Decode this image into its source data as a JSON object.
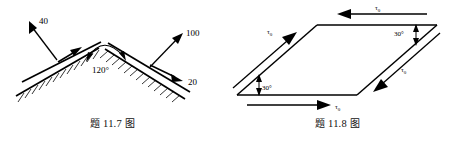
{
  "page": {
    "background_color": "#ffffff",
    "ink_color": "#000000",
    "width": 450,
    "height": 141
  },
  "figures": [
    {
      "id": "fig-11-7",
      "caption": "题 11.7 图",
      "caption_prefix": "题",
      "caption_number": "11.7",
      "caption_suffix": "图",
      "type": "engineering-diagram",
      "description": "V-shaped hatched bracket with apex angle and three force labels",
      "apex_angle": {
        "value": "120°",
        "label": "120°",
        "style": "double-headed-arc"
      },
      "labels": [
        {
          "name": "force-40",
          "text": "40",
          "direction": "up-left",
          "x": 36,
          "y": 22
        },
        {
          "name": "force-100",
          "text": "100",
          "direction": "up-right",
          "x": 196,
          "y": 33
        },
        {
          "name": "force-20",
          "text": "20",
          "direction": "down-right",
          "x": 206,
          "y": 82
        }
      ],
      "hatching": {
        "left_surface_ticks": 12,
        "right_surface_ticks": 13,
        "side": "below"
      }
    },
    {
      "id": "fig-11-8",
      "caption": "题 11.8 图",
      "caption_prefix": "题",
      "caption_number": "11.8",
      "caption_suffix": "图",
      "type": "engineering-diagram",
      "description": "Sheared parallelogram element with pure shear stress tau-zero on all four faces",
      "stress_symbol": "τ",
      "stress_subscript": "0",
      "stress_label": "τ0",
      "angles": [
        {
          "name": "angle-bottom-left",
          "text": "30°",
          "x": 36,
          "y": 86
        },
        {
          "name": "angle-top-right",
          "text": "30°",
          "x": 152,
          "y": 29
        }
      ],
      "edge_arrows": [
        {
          "name": "tau-top",
          "edge": "top",
          "direction": "left",
          "label": "τ0"
        },
        {
          "name": "tau-left",
          "edge": "left",
          "direction": "up-right",
          "label": "τ0"
        },
        {
          "name": "tau-bottom",
          "edge": "bottom",
          "direction": "right",
          "label": "τ0"
        },
        {
          "name": "tau-right",
          "edge": "right",
          "direction": "down-left",
          "label": "τ0"
        }
      ]
    }
  ]
}
